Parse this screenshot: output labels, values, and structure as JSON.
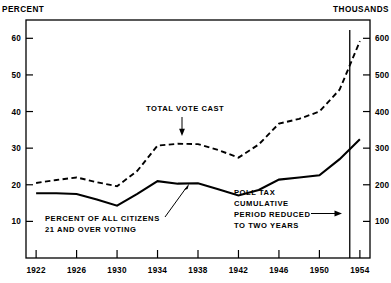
{
  "chart_data": {
    "type": "line",
    "title": "",
    "subtitle": "",
    "xlabel": "",
    "ylabel": "PERCENT",
    "y2label": "THOUSANDS",
    "grid": false,
    "legend_position": "inline-annotations",
    "x": [
      1922,
      1924,
      1926,
      1928,
      1930,
      1932,
      1934,
      1936,
      1938,
      1940,
      1942,
      1944,
      1946,
      1948,
      1950,
      1952,
      1954
    ],
    "xlim": [
      1921,
      1955
    ],
    "xticks": [
      1922,
      1926,
      1930,
      1934,
      1938,
      1942,
      1946,
      1950,
      1954
    ],
    "xtick_labels": [
      "1922",
      "1926",
      "1930",
      "1934",
      "1938",
      "1942",
      "1946",
      "1950",
      "1954"
    ],
    "ylim": [
      0,
      65
    ],
    "yticks": [
      10,
      20,
      30,
      40,
      50,
      60
    ],
    "ytick_labels": [
      "10",
      "20",
      "30",
      "40",
      "50",
      "60"
    ],
    "y2lim": [
      0,
      650
    ],
    "y2ticks": [
      100,
      200,
      300,
      400,
      500,
      600
    ],
    "y2tick_labels": [
      "100",
      "200",
      "300",
      "400",
      "500",
      "600"
    ],
    "series": [
      {
        "name": "PERCENT OF ALL CITIZENS 21 AND OVER VOTING",
        "style": "solid",
        "axis": "left",
        "unit": "percent",
        "values": [
          17.7,
          17.7,
          17.5,
          16.0,
          14.3,
          17.5,
          21.0,
          20.3,
          20.4,
          18.8,
          17.1,
          18.6,
          21.4,
          22.0,
          22.6,
          27.0,
          32.4
        ]
      },
      {
        "name": "TOTAL VOTE CAST",
        "style": "dashed",
        "axis": "right",
        "unit": "thousands",
        "values": [
          205,
          213,
          220,
          207,
          196,
          238,
          307,
          312,
          311,
          295,
          274,
          310,
          367,
          380,
          400,
          460,
          592
        ]
      }
    ],
    "annotations": [
      {
        "name": "total-vote-cast",
        "text": "TOTAL VOTE CAST",
        "arrow": "down",
        "points_to_year": 1937
      },
      {
        "name": "percent-citizens-voting",
        "text_lines": [
          "PERCENT OF ALL CITIZENS",
          "21 AND OVER VOTING"
        ],
        "arrow": "up-right",
        "points_to_year": 1938
      },
      {
        "name": "poll-tax-note",
        "text_lines": [
          "POLL TAX",
          "CUMULATIVE",
          "PERIOD REDUCED",
          "TO TWO YEARS"
        ],
        "arrow": "right",
        "points_to_year": 1953
      }
    ],
    "event_lines": [
      {
        "name": "poll-tax-reduction",
        "year": 1953
      }
    ]
  },
  "labels": {
    "left_axis_unit": "PERCENT",
    "right_axis_unit": "THOUSANDS"
  },
  "colors": {
    "ink": "#000000",
    "background": "#ffffff"
  }
}
